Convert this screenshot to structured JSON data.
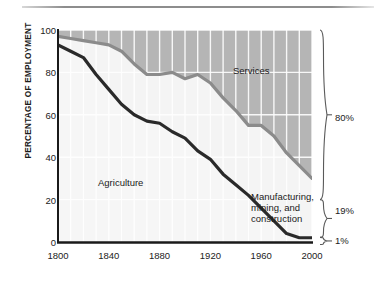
{
  "figure": {
    "y_axis_title": "PERCENTAGE OF EMPLOYMENT"
  },
  "annotations": {
    "services": "Services",
    "agriculture": "Agriculture",
    "manufacturing_line1": "Manufacturing,",
    "manufacturing_line2": "mining, and",
    "manufacturing_line3": "construction"
  },
  "braces": {
    "services_share": "80%",
    "manufacturing_share": "19%",
    "agriculture_share": "1%"
  },
  "colors": {
    "services_band": "#b5b5b5",
    "agriculture_band": "#f4f4f4",
    "services_line": "#8b8b8b",
    "agriculture_line": "#2a2a2a",
    "gridline": "#ffffff",
    "axis": "#1a1a1a",
    "text": "#222222"
  },
  "chart_data": {
    "type": "area",
    "title": "",
    "xlabel": "",
    "ylabel": "PERCENTAGE OF EMPLOYMENT",
    "xlim": [
      1800,
      2000
    ],
    "ylim": [
      0,
      100
    ],
    "xticks": [
      1800,
      1840,
      1880,
      1920,
      1960,
      2000
    ],
    "yticks": [
      0,
      20,
      40,
      60,
      80,
      100
    ],
    "grid": true,
    "grid_x_step": 10,
    "grid_y_step": 20,
    "legend": "in-chart labels",
    "x": [
      1800,
      1810,
      1820,
      1830,
      1840,
      1850,
      1860,
      1870,
      1880,
      1890,
      1900,
      1910,
      1920,
      1930,
      1940,
      1950,
      1960,
      1970,
      1980,
      1990,
      2000
    ],
    "series": [
      {
        "name": "Agriculture",
        "note": "lower boundary line; area below is Agriculture",
        "values": [
          93,
          90,
          87,
          79,
          72,
          65,
          60,
          57,
          56,
          52,
          49,
          43,
          39,
          32,
          27,
          22,
          16,
          10,
          4,
          2,
          2
        ]
      },
      {
        "name": "Agriculture + Manufacturing, mining, and construction",
        "note": "upper boundary line; area above is Services",
        "values": [
          97,
          96,
          95,
          94,
          93,
          90,
          84,
          79,
          79,
          80,
          77,
          79,
          75,
          68,
          62,
          55,
          55,
          50,
          42,
          36,
          30
        ]
      }
    ],
    "final_year_shares": {
      "Services": 80,
      "Manufacturing, mining, and construction": 19,
      "Agriculture": 1
    }
  }
}
